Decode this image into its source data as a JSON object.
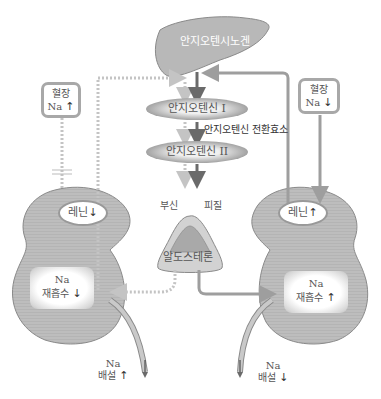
{
  "liver": {
    "label": "안지오텐시노겐"
  },
  "cascade": {
    "angiotensin1": "안지오텐신 I",
    "enzyme": "안지오텐신 전환효소",
    "angiotensin2": "안지오텐신 II",
    "adrenal_left": "부신",
    "adrenal_right": "피질",
    "aldosterone": "알도스테론"
  },
  "left": {
    "plasma_line1": "혈장",
    "plasma_line2": "Na",
    "plasma_arrow": "↑",
    "renin_label": "레닌",
    "renin_arrow": "↓",
    "reabs_line1": "Na",
    "reabs_line2": "재흡수",
    "reabs_arrow": "↓",
    "excr_line1": "Na",
    "excr_line2": "배설",
    "excr_arrow": "↑"
  },
  "right": {
    "plasma_line1": "혈장",
    "plasma_line2": "Na",
    "plasma_arrow": "↓",
    "renin_label": "레닌",
    "renin_arrow": "↑",
    "reabs_line1": "Na",
    "reabs_line2": "재흡수",
    "reabs_arrow": "↑",
    "excr_line1": "Na",
    "excr_line2": "배설",
    "excr_arrow": "↓"
  },
  "colors": {
    "organ_fill": "#b5b5b5",
    "organ_stroke": "#8a8a8a",
    "solid_arrow": "#9e9e9e",
    "dotted_arrow": "#c4c4c4",
    "dark_arrow": "#6a6a6a"
  }
}
